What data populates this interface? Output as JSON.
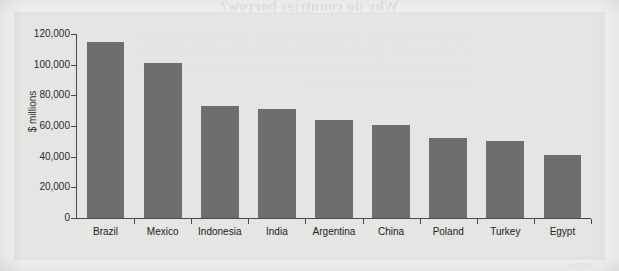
{
  "background": {
    "bleed_title": "Why do countries borrow?",
    "bleed_paragraph": "borrowed to build roads and schools and hospitals, and to finance investment in their industries; governments of rich countries have borrowed to pay for wars and welfare. Borrowing can be sensible, and lending can be profitable, but in many cases it has proved ruinous.",
    "bleed_footer": "borrow"
  },
  "chart_data": {
    "type": "bar",
    "title": "",
    "xlabel": "",
    "ylabel": "$ millions",
    "ylim": [
      0,
      120000
    ],
    "ytick_values": [
      0,
      20000,
      40000,
      60000,
      80000,
      100000,
      120000
    ],
    "ytick_labels": [
      "0",
      "20,000",
      "40,000",
      "60,000",
      "80,000",
      "100,000",
      "120,000"
    ],
    "grid": false,
    "legend": false,
    "bar_color": "#6e6e6e",
    "categories": [
      "Brazil",
      "Mexico",
      "Indonesia",
      "India",
      "Argentina",
      "China",
      "Poland",
      "Turkey",
      "Egypt"
    ],
    "values": [
      115000,
      101000,
      73000,
      71000,
      64000,
      60500,
      52500,
      50000,
      41000
    ]
  }
}
